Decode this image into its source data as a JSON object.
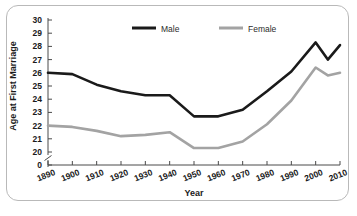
{
  "chart_data": {
    "type": "line",
    "title": "",
    "xlabel": "Year",
    "ylabel": "Age at First Marriage",
    "x": [
      1890,
      1900,
      1910,
      1920,
      1930,
      1940,
      1950,
      1960,
      1970,
      1980,
      1990,
      2000,
      2005,
      2010
    ],
    "xtick_labels": [
      "1890",
      "1900",
      "1910",
      "1920",
      "1930",
      "1940",
      "1950",
      "1960",
      "1970",
      "1980",
      "1990",
      "2000",
      "2010"
    ],
    "xticks": [
      1890,
      1900,
      1910,
      1920,
      1930,
      1940,
      1950,
      1960,
      1970,
      1980,
      1990,
      2000,
      2010
    ],
    "xlim": [
      1890,
      2010
    ],
    "ytick_labels": [
      "0",
      "20",
      "21",
      "22",
      "23",
      "24",
      "25",
      "26",
      "27",
      "28",
      "29",
      "30"
    ],
    "yticks": [
      0,
      20,
      21,
      22,
      23,
      24,
      25,
      26,
      27,
      28,
      29,
      30
    ],
    "ylim": [
      20,
      30
    ],
    "y_axis_break": true,
    "grid": false,
    "legend_position": "top-center",
    "series": [
      {
        "name": "Male",
        "color": "#1a1a1a",
        "values": [
          26.0,
          25.9,
          25.1,
          24.6,
          24.3,
          24.3,
          22.7,
          22.7,
          23.2,
          24.6,
          26.1,
          28.3,
          27.0,
          28.1
        ]
      },
      {
        "name": "Female",
        "color": "#a3a3a3",
        "values": [
          22.0,
          21.9,
          21.6,
          21.2,
          21.3,
          21.5,
          20.3,
          20.3,
          20.8,
          22.1,
          23.9,
          26.4,
          25.8,
          26.0
        ]
      }
    ]
  },
  "axes": {
    "y_label": "Age at First Marriage",
    "x_label": "Year"
  },
  "legend": {
    "items": [
      {
        "label": "Male",
        "color": "#1a1a1a"
      },
      {
        "label": "Female",
        "color": "#a3a3a3"
      }
    ]
  },
  "colors": {
    "male": "#1a1a1a",
    "female": "#a3a3a3",
    "axis": "#4a4a4a",
    "frame_border": "#b9b9b9",
    "background": "#ffffff"
  }
}
